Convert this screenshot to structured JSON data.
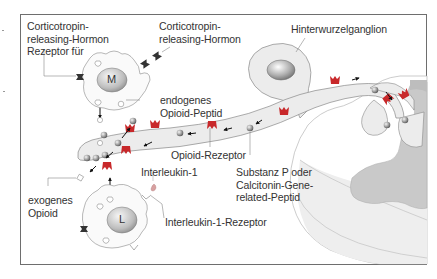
{
  "figure": {
    "labels": {
      "crh_receptor": "Corticotropin-\nreleasing-Hormon\nRezeptor für",
      "crh": "Corticotropin-\nreleasing-Hormon",
      "drg": "Hinterwurzelganglion",
      "endogenous_opioid": "endogenes\nOpioid-Peptid",
      "opioid_receptor": "Opioid-Rezeptor",
      "substance_p": "Substanz P oder\nCalcitonin-Gene-\nrelated-Peptid",
      "interleukin": "Interleukin-1",
      "exogenous_opioid": "exogenes\nOpioid",
      "il1_receptor": "Interleukin-1-Rezeptor"
    },
    "cells": {
      "macrophage": "M",
      "lymphocyte": "L"
    },
    "colors": {
      "receptor_red": "#c8282a",
      "axon_fill": "#ececec",
      "spinal_gray": "#c9c9c9",
      "frame": "#6e6e6e",
      "text": "#333333"
    }
  }
}
